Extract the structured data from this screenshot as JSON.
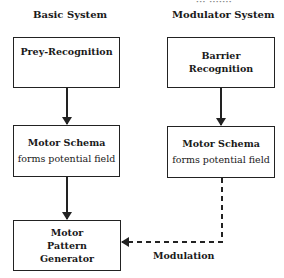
{
  "top_cutoff_text": "··· ·······",
  "columns": {
    "basic": {
      "heading": "Basic System"
    },
    "modulator": {
      "heading": "Modulator System"
    }
  },
  "nodes": {
    "prey_recognition": {
      "line1": "Prey-Recognition"
    },
    "barrier_recognition": {
      "line1": "Barrier",
      "line2": "Recognition"
    },
    "motor_schema_basic": {
      "line1": "Motor Schema",
      "line2": "forms potential field"
    },
    "motor_schema_modulator": {
      "line1": "Motor Schema",
      "line2": "forms potential field"
    },
    "motor_pattern_generator": {
      "line1": "Motor",
      "line2": "Pattern",
      "line3": "Generator"
    }
  },
  "edges": [
    {
      "from": "prey_recognition",
      "to": "motor_schema_basic",
      "style": "solid"
    },
    {
      "from": "motor_schema_basic",
      "to": "motor_pattern_generator",
      "style": "solid"
    },
    {
      "from": "barrier_recognition",
      "to": "motor_schema_modulator",
      "style": "solid"
    },
    {
      "from": "motor_schema_modulator",
      "to": "motor_pattern_generator",
      "style": "dashed",
      "label": "Modulation"
    }
  ],
  "labels": {
    "modulation": "Modulation"
  },
  "colors": {
    "line": "#222222",
    "background": "#ffffff"
  }
}
